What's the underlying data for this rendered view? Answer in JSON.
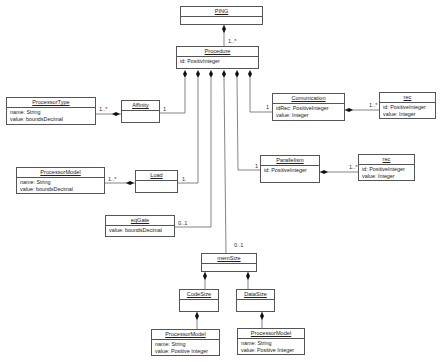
{
  "diagram": {
    "type": "UML class diagram",
    "classes": {
      "ping": {
        "name": "PING",
        "attributes": []
      },
      "procedure": {
        "name": "Procedure",
        "attributes": [
          "id: PositivInteger"
        ]
      },
      "processor_type": {
        "name": "ProcessorType",
        "attributes": [
          "name: String",
          "value: boundsDecimal"
        ]
      },
      "affinity": {
        "name": "Affinity",
        "attributes": []
      },
      "comunication": {
        "name": "Comunication",
        "attributes": [
          "idRec: PositiveInteger",
          "value: Integer"
        ]
      },
      "rec_comm": {
        "name": "rec",
        "attributes": [
          "id: PositiveInteger",
          "value: Integer"
        ]
      },
      "parallelism": {
        "name": "Parallelism",
        "attributes": [
          "id: PositiveInteger"
        ]
      },
      "rec_par": {
        "name": "rec",
        "attributes": [
          "id: PositiveInteger",
          "value: Integer"
        ]
      },
      "processor_model_load": {
        "name": "ProcessorModel",
        "attributes": [
          "name: String",
          "value: boundsDecimal"
        ]
      },
      "load": {
        "name": "Load",
        "attributes": []
      },
      "eq_gate": {
        "name": "eqGate",
        "attributes": [
          "value: boundsDecimal"
        ]
      },
      "mem_size": {
        "name": "memSize",
        "attributes": []
      },
      "code_size": {
        "name": "CodeSize",
        "attributes": []
      },
      "data_size": {
        "name": "DataSize",
        "attributes": []
      },
      "processor_model_code": {
        "name": "ProcessorModel",
        "attributes": [
          "name: String",
          "value: Positive Integer"
        ]
      },
      "processor_model_data": {
        "name": "ProcessorModel",
        "attributes": [
          "name: String",
          "value: Positive Integer"
        ]
      }
    },
    "multiplicities": {
      "ping_procedure": "1..*",
      "affinity_to_procedure": "1",
      "processor_type_affinity": "1..*",
      "comunication_to_procedure": "1",
      "rec_comm": "1..*",
      "parallelism_to_procedure": "1",
      "rec_par": "1..*",
      "load_to_procedure": "1",
      "processor_model_load": "1..*",
      "eq_gate_to_procedure": "0..1",
      "mem_size_to_procedure": "0..1"
    },
    "colors": {
      "line": "#555555",
      "background": "#ffffff",
      "text": "#222222"
    }
  }
}
